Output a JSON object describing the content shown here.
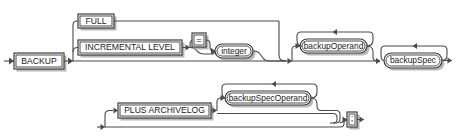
{
  "diagram": {
    "kind": "railroad-syntax-diagram",
    "name": "backup",
    "stroke_color": "#4a4a4a",
    "box_border_color": "#3a3a3a",
    "shadow_color": "#b8b8b8",
    "background_color": "#ffffff",
    "text_color": "#1a1a1a",
    "nodes": {
      "backup": {
        "label": "BACKUP",
        "shape": "rect",
        "x": 14,
        "y": 53,
        "w": 50,
        "h": 16
      },
      "full": {
        "label": "FULL",
        "shape": "rect",
        "x": 78,
        "y": 14,
        "w": 36,
        "h": 14
      },
      "incremental_level": {
        "label": "INCREMENTAL LEVEL",
        "shape": "rect",
        "x": 78,
        "y": 40,
        "w": 104,
        "h": 15
      },
      "equals": {
        "label": "=",
        "shape": "rect",
        "x": 192,
        "y": 33,
        "w": 14,
        "h": 14
      },
      "integer": {
        "label": "integer",
        "shape": "oval",
        "x": 215,
        "y": 44,
        "w": 38,
        "h": 14
      },
      "backup_operand": {
        "label": "backupOperand",
        "shape": "oval",
        "x": 288,
        "y": 39,
        "w": 67,
        "h": 14
      },
      "backup_spec": {
        "label": "backupSpec",
        "shape": "oval",
        "x": 384,
        "y": 53,
        "w": 58,
        "h": 15
      },
      "plus_archivelog": {
        "label": "PLUS ARCHIVELOG",
        "shape": "rect",
        "x": 118,
        "y": 103,
        "w": 93,
        "h": 15
      },
      "backup_spec_operand": {
        "label": "backupSpecOperand",
        "shape": "oval",
        "x": 225,
        "y": 91,
        "w": 86,
        "h": 14
      },
      "semicolon": {
        "label": ";",
        "shape": "rect",
        "x": 347,
        "y": 112,
        "w": 10,
        "h": 15
      }
    },
    "loops": [
      {
        "for": "backup_operand",
        "direction": "right-to-left",
        "label": "repeat"
      },
      {
        "for": "backup_spec",
        "direction": "right-to-left",
        "label": "repeat"
      },
      {
        "for": "backup_spec_operand",
        "direction": "right-to-left",
        "label": "repeat"
      }
    ],
    "optional_bypasses": [
      {
        "for": "full-or-incremental-group",
        "label": "skip"
      },
      {
        "for": "equals",
        "label": "skip"
      },
      {
        "for": "backup_operand",
        "label": "skip"
      },
      {
        "for": "plus-archivelog-group",
        "label": "skip"
      },
      {
        "for": "backup_spec_operand",
        "label": "skip"
      }
    ],
    "flow_rows": [
      {
        "row": "top",
        "y": 61,
        "description": "BACKUP main line continues to backupSpec"
      },
      {
        "row": "bottom",
        "y": 127,
        "description": "PLUS ARCHIVELOG optional line ending at semicolon terminator"
      }
    ]
  }
}
